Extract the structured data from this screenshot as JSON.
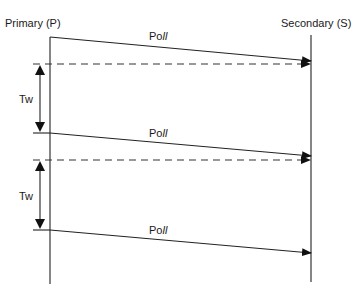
{
  "diagram": {
    "type": "sequence-timing",
    "lifelines": [
      {
        "id": "primary",
        "label": "Primary (P)",
        "x": 50,
        "y1": 37,
        "y2": 284,
        "label_x": 5,
        "label_y": 27
      },
      {
        "id": "secondary",
        "label": "Secondary (S)",
        "x": 311,
        "y1": 35,
        "y2": 282,
        "label_x": 281,
        "label_y": 27
      }
    ],
    "messages": [
      {
        "label": "Poll",
        "from": "primary",
        "to": "secondary",
        "style": "solid",
        "x1": 50,
        "y1": 37,
        "x2": 311,
        "y2": 61,
        "label_x": 149,
        "label_y": 40
      },
      {
        "label": "Poll",
        "from": "primary",
        "to": "secondary",
        "style": "solid",
        "x1": 50,
        "y1": 133,
        "x2": 311,
        "y2": 156,
        "label_x": 149,
        "label_y": 137
      },
      {
        "label": "Poll",
        "from": "primary",
        "to": "secondary",
        "style": "solid",
        "x1": 50,
        "y1": 230,
        "x2": 311,
        "y2": 253,
        "label_x": 149,
        "label_y": 234
      }
    ],
    "dashed_lines": [
      {
        "x1": 33,
        "y1": 64,
        "x2": 311,
        "y2": 64
      },
      {
        "x1": 33,
        "y1": 160,
        "x2": 311,
        "y2": 160
      }
    ],
    "ticks": [
      {
        "x1": 33,
        "y1": 133,
        "x2": 50,
        "y2": 133
      },
      {
        "x1": 33,
        "y1": 230,
        "x2": 50,
        "y2": 230
      }
    ],
    "intervals": [
      {
        "label": "Tw",
        "x": 40,
        "y1": 64,
        "y2": 133,
        "label_x": 19,
        "label_y": 103
      },
      {
        "label": "Tw",
        "x": 40,
        "y1": 160,
        "y2": 230,
        "label_x": 19,
        "label_y": 200
      }
    ],
    "labels": {
      "primary": "Primary (P)",
      "secondary": "Secondary (S)",
      "poll_1": "Poll",
      "poll_2": "Poll",
      "poll_3": "Poll",
      "tw_1": "Tw",
      "tw_2": "Tw"
    }
  }
}
